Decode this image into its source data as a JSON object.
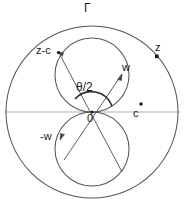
{
  "figure": {
    "colors": {
      "stroke": "#444444",
      "axis": "#9a9a9a",
      "label": "#1a1a1a",
      "background": "#ffffff"
    },
    "labels": {
      "gamma": "Γ",
      "z": "z",
      "z_minus_c": "z-c",
      "w": "w",
      "theta_over_two": "θ/2",
      "origin": "0",
      "c": "c",
      "minus_w": "-w"
    },
    "geometry": {
      "outer_circle": {
        "cx": 92,
        "cy": 112,
        "r": 86
      },
      "lemniscate_upper_lobe": {
        "cx": 92,
        "cy": 75,
        "r": 37
      },
      "lemniscate_lower_lobe": {
        "cx": 92,
        "cy": 149,
        "r": 37
      },
      "origin_point": {
        "x": 92,
        "y": 112
      },
      "point_z": {
        "x": 157,
        "y": 57
      },
      "point_c": {
        "x": 141,
        "y": 104
      },
      "point_z_minus_c": {
        "x": 58,
        "y": 52
      },
      "point_w_arrow_tip": {
        "x": 120,
        "y": 76
      },
      "point_minus_w_arrow_tip": {
        "x": 60,
        "y": 140
      },
      "angle_arc_radius": 20,
      "horizontal_axis": {
        "x1": 8,
        "y1": 112,
        "x2": 178,
        "y2": 112
      }
    }
  }
}
